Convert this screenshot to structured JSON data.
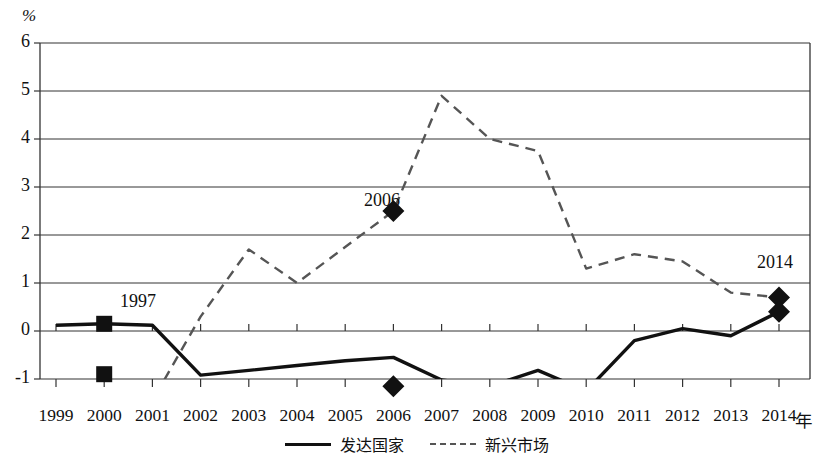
{
  "chart_data": {
    "type": "line",
    "title": "",
    "xlabel": "年",
    "ylabel": "%",
    "ylim": [
      -1,
      6
    ],
    "yticks": [
      -1,
      0,
      1,
      2,
      3,
      4,
      5,
      6
    ],
    "ytick_labels": [
      "-1",
      "0",
      "1",
      "2",
      "3",
      "4",
      "5",
      "6"
    ],
    "grid": true,
    "legend_position": "bottom-center",
    "x": [
      1999,
      2000,
      2001,
      2002,
      2003,
      2004,
      2005,
      2006,
      2007,
      2008,
      2009,
      2010,
      2011,
      2012,
      2013,
      2014
    ],
    "xtick_labels": [
      "1999",
      "2000",
      "2001",
      "2002",
      "2003",
      "2004",
      "2005",
      "2006",
      "2007",
      "2008",
      "2009",
      "2010",
      "2011",
      "2012",
      "2013",
      "2014"
    ],
    "series": [
      {
        "name": "发达国家",
        "style": "solid",
        "color": "#111111",
        "values": [
          0.12,
          0.15,
          0.12,
          -0.92,
          -0.82,
          -0.72,
          -0.62,
          -0.55,
          -1.02,
          -1.15,
          -0.82,
          -1.25,
          -0.2,
          0.05,
          -0.1,
          0.4
        ]
      },
      {
        "name": "新兴市场",
        "style": "dashed",
        "color": "#555555",
        "values": [
          -2.6,
          -2.2,
          -1.45,
          0.3,
          1.7,
          1.0,
          1.75,
          2.5,
          4.9,
          4.0,
          3.75,
          1.3,
          1.6,
          1.45,
          0.8,
          0.7
        ]
      }
    ],
    "markers": [
      {
        "label": "1997",
        "year": 2000,
        "shape": "square",
        "points": [
          {
            "series": "发达国家",
            "value": 0.15
          },
          {
            "series": "新兴市场",
            "value": -0.9
          }
        ]
      },
      {
        "label": "2006",
        "year": 2006,
        "shape": "diamond",
        "points": [
          {
            "series": "新兴市场",
            "value": 2.5
          },
          {
            "series": "发达国家",
            "value": -1.15
          }
        ]
      },
      {
        "label": "2014",
        "year": 2014,
        "shape": "diamond",
        "points": [
          {
            "series": "新兴市场",
            "value": 0.7
          },
          {
            "series": "发达国家",
            "value": 0.4
          }
        ]
      }
    ],
    "annotations": [
      {
        "text": "1997",
        "x_px": 120,
        "y_px": 291
      },
      {
        "text": "2006",
        "x_px": 364,
        "y_px": 190
      },
      {
        "text": "2014",
        "x_px": 757,
        "y_px": 252
      }
    ]
  },
  "legend": {
    "entries": [
      {
        "label": "发达国家",
        "style": "solid"
      },
      {
        "label": "新兴市场",
        "style": "dashed"
      }
    ]
  }
}
